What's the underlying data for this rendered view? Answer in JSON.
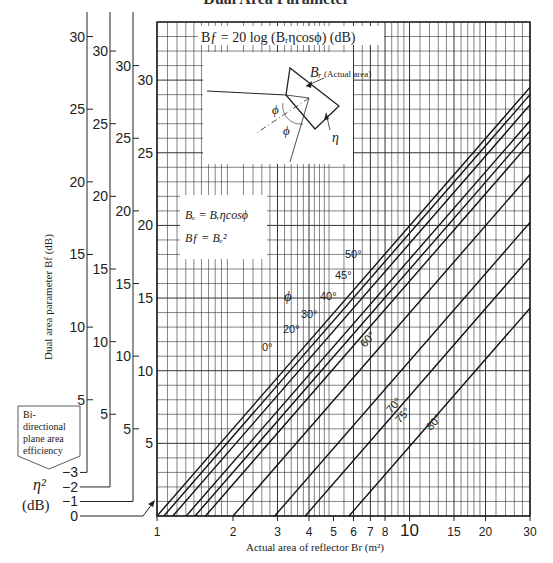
{
  "header": {
    "title": "Dual Area Parameter"
  },
  "formula_box": {
    "main_formula": "Bƒ = 20 log (Bᵣηcosϕ) (dB)",
    "br_label": "Bᵣ",
    "br_note": "(Actual area)",
    "phi": "ϕ",
    "eta": "η"
  },
  "definition_box": {
    "line1": "Bₑ = Bᵣηcosϕ",
    "line2": "Bƒ = Bₑ²"
  },
  "efficiency_box": {
    "lines": [
      "Bi-",
      "directional",
      "plane area",
      "efficiency"
    ]
  },
  "eta_axis": {
    "label_symbol": "η²",
    "label_unit": "(dB)",
    "values": [
      "−3",
      "−2",
      "−1",
      "0"
    ]
  },
  "phi_label": "ϕ",
  "chart_data": {
    "type": "line",
    "title": "Dual area parameter",
    "formula": "Bf = 20 log (Br η cos ϕ) (dB)",
    "xlabel": "Actual area of reflector Br (m²)",
    "ylabel": "Dual area parameter Bf (dB)",
    "xscale": "log",
    "xlim": [
      1,
      30
    ],
    "ylim": [
      0,
      34
    ],
    "xticks": [
      1,
      2,
      3,
      4,
      5,
      6,
      7,
      8,
      10,
      15,
      20,
      30
    ],
    "xtick_labels": [
      "1",
      "2",
      "3",
      "4",
      "5",
      "6",
      "7",
      "8",
      "10",
      "15",
      "20",
      "30"
    ],
    "yticks": [
      5,
      10,
      15,
      20,
      25,
      30
    ],
    "grid": true,
    "eta_offset_axes_dB": [
      0,
      -1,
      -2,
      -3
    ],
    "series": [
      {
        "name": "0°",
        "phi_deg": 0,
        "x": [
          1,
          30
        ],
        "values": [
          0.0,
          29.5
        ]
      },
      {
        "name": "20°",
        "phi_deg": 20,
        "x": [
          1.064,
          30
        ],
        "values": [
          0.0,
          29.0
        ]
      },
      {
        "name": "30°",
        "phi_deg": 30,
        "x": [
          1.155,
          30
        ],
        "values": [
          0.0,
          28.3
        ]
      },
      {
        "name": "40°",
        "phi_deg": 40,
        "x": [
          1.305,
          30
        ],
        "values": [
          0.0,
          27.2
        ]
      },
      {
        "name": "45°",
        "phi_deg": 45,
        "x": [
          1.414,
          30
        ],
        "values": [
          0.0,
          26.5
        ]
      },
      {
        "name": "50°",
        "phi_deg": 50,
        "x": [
          1.556,
          30
        ],
        "values": [
          0.0,
          25.7
        ]
      },
      {
        "name": "60°",
        "phi_deg": 60,
        "x": [
          2.0,
          30
        ],
        "values": [
          0.0,
          23.5
        ]
      },
      {
        "name": "70°",
        "phi_deg": 70,
        "x": [
          2.924,
          30
        ],
        "values": [
          0.0,
          20.2
        ]
      },
      {
        "name": "75°",
        "phi_deg": 75,
        "x": [
          3.864,
          30
        ],
        "values": [
          0.0,
          17.8
        ]
      },
      {
        "name": "80°",
        "phi_deg": 80,
        "x": [
          5.759,
          30
        ],
        "values": [
          0.0,
          14.3
        ]
      }
    ],
    "legend": "inline labels on lines"
  }
}
